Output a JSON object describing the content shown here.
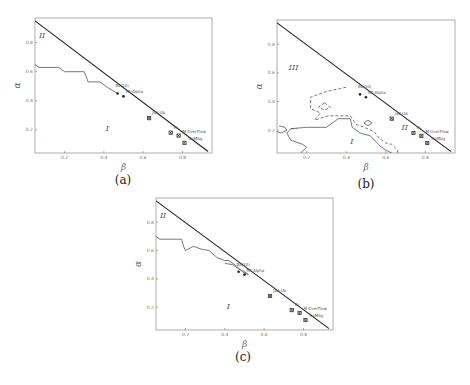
{
  "figure": {
    "panels": [
      {
        "id": "a",
        "caption": "(a)"
      },
      {
        "id": "b",
        "caption": "(b)"
      },
      {
        "id": "c",
        "caption": "(c)"
      }
    ]
  },
  "chart_data": [
    {
      "type": "line",
      "panel": "(a)",
      "xlabel": "β",
      "ylabel": "α",
      "xlim": [
        0.05,
        0.95
      ],
      "ylim": [
        0.04,
        0.97
      ],
      "xticks": [
        0.2,
        0.4,
        0.6,
        0.8
      ],
      "yticks": [
        0.2,
        0.4,
        0.6,
        0.8
      ],
      "grid": false,
      "boundary_line": [
        [
          0.05,
          0.95
        ],
        [
          0.93,
          0.05
        ]
      ],
      "curves": [
        {
          "name": "phase boundary",
          "style": "solid",
          "points": [
            [
              0.05,
              0.65
            ],
            [
              0.07,
              0.63
            ],
            [
              0.17,
              0.63
            ],
            [
              0.2,
              0.6
            ],
            [
              0.3,
              0.6
            ],
            [
              0.31,
              0.57
            ],
            [
              0.32,
              0.53
            ],
            [
              0.38,
              0.53
            ],
            [
              0.42,
              0.49
            ],
            [
              0.47,
              0.45
            ]
          ]
        }
      ],
      "regions": [
        {
          "label": "II",
          "x": 0.07,
          "y": 0.83
        },
        {
          "label": "I",
          "x": 0.41,
          "y": 0.19
        }
      ],
      "points": [
        {
          "label": "Bk(10)",
          "x": 0.47,
          "y": 0.45,
          "marker": "dot"
        },
        {
          "label": "RF-Alpha",
          "x": 0.5,
          "y": 0.43,
          "marker": "dot"
        },
        {
          "label": "Jad-Ub",
          "x": 0.63,
          "y": 0.28,
          "marker": "x"
        },
        {
          "label": "Rc",
          "x": 0.74,
          "y": 0.18,
          "marker": "x"
        },
        {
          "label": "M OverFlow",
          "x": 0.78,
          "y": 0.16,
          "marker": "x"
        },
        {
          "label": "CoMbg",
          "x": 0.81,
          "y": 0.11,
          "marker": "x"
        }
      ]
    },
    {
      "type": "line",
      "panel": "(b)",
      "xlabel": "β",
      "ylabel": "α",
      "xlim": [
        0.05,
        0.95
      ],
      "ylim": [
        0.04,
        0.97
      ],
      "xticks": [
        0.2,
        0.4,
        0.6,
        0.8
      ],
      "yticks": [
        0.2,
        0.4,
        0.6,
        0.8
      ],
      "grid": false,
      "boundary_line": [
        [
          0.05,
          0.95
        ],
        [
          0.93,
          0.05
        ]
      ],
      "curves": [
        {
          "name": "region I boundary",
          "style": "solid",
          "points": [
            [
              0.17,
              0.04
            ],
            [
              0.2,
              0.08
            ],
            [
              0.18,
              0.1
            ],
            [
              0.12,
              0.13
            ],
            [
              0.1,
              0.18
            ],
            [
              0.12,
              0.21
            ],
            [
              0.2,
              0.22
            ],
            [
              0.3,
              0.22
            ],
            [
              0.36,
              0.28
            ],
            [
              0.42,
              0.28
            ],
            [
              0.43,
              0.22
            ],
            [
              0.47,
              0.18
            ],
            [
              0.52,
              0.16
            ],
            [
              0.55,
              0.12
            ],
            [
              0.57,
              0.09
            ],
            [
              0.6,
              0.06
            ],
            [
              0.63,
              0.04
            ]
          ]
        },
        {
          "name": "region III boundary",
          "style": "dashed",
          "points": [
            [
              0.4,
              0.5
            ],
            [
              0.3,
              0.47
            ],
            [
              0.22,
              0.43
            ],
            [
              0.22,
              0.35
            ],
            [
              0.27,
              0.32
            ],
            [
              0.24,
              0.27
            ],
            [
              0.31,
              0.3
            ],
            [
              0.36,
              0.3
            ],
            [
              0.42,
              0.3
            ],
            [
              0.45,
              0.24
            ],
            [
              0.49,
              0.22
            ],
            [
              0.54,
              0.19
            ],
            [
              0.57,
              0.14
            ],
            [
              0.6,
              0.11
            ],
            [
              0.63,
              0.1
            ],
            [
              0.66,
              0.06
            ],
            [
              0.66,
              0.04
            ]
          ]
        },
        {
          "name": "region III island",
          "style": "dashed",
          "points": [
            [
              0.29,
              0.39
            ],
            [
              0.32,
              0.36
            ],
            [
              0.29,
              0.34
            ],
            [
              0.26,
              0.36
            ],
            [
              0.29,
              0.39
            ]
          ]
        },
        {
          "name": "small island",
          "style": "solid",
          "points": [
            [
              0.51,
              0.27
            ],
            [
              0.53,
              0.25
            ],
            [
              0.51,
              0.23
            ],
            [
              0.49,
              0.25
            ],
            [
              0.51,
              0.27
            ]
          ]
        },
        {
          "name": "left island",
          "style": "solid",
          "points": [
            [
              0.06,
              0.23
            ],
            [
              0.09,
              0.22
            ],
            [
              0.1,
              0.2
            ],
            [
              0.07,
              0.18
            ],
            [
              0.05,
              0.19
            ]
          ]
        },
        {
          "name": "left connector",
          "style": "dashed",
          "points": [
            [
              0.12,
              0.21
            ],
            [
              0.15,
              0.21
            ]
          ]
        }
      ],
      "regions": [
        {
          "label": "III",
          "x": 0.11,
          "y": 0.62
        },
        {
          "label": "II",
          "x": 0.68,
          "y": 0.2
        },
        {
          "label": "I",
          "x": 0.42,
          "y": 0.1
        }
      ],
      "points": [
        {
          "label": "Bk(10)",
          "x": 0.47,
          "y": 0.45,
          "marker": "dot"
        },
        {
          "label": "RF-Alpha",
          "x": 0.5,
          "y": 0.43,
          "marker": "dot"
        },
        {
          "label": "Jad-Ub",
          "x": 0.63,
          "y": 0.28,
          "marker": "x"
        },
        {
          "label": "Rc",
          "x": 0.74,
          "y": 0.18,
          "marker": "x"
        },
        {
          "label": "M OverFlow",
          "x": 0.78,
          "y": 0.16,
          "marker": "x"
        },
        {
          "label": "CoMbg",
          "x": 0.81,
          "y": 0.11,
          "marker": "x"
        }
      ]
    },
    {
      "type": "line",
      "panel": "(c)",
      "xlabel": "β",
      "ylabel": "α",
      "xlim": [
        0.05,
        0.95
      ],
      "ylim": [
        0.04,
        0.97
      ],
      "xticks": [
        0.2,
        0.4,
        0.6,
        0.8
      ],
      "yticks": [
        0.2,
        0.4,
        0.6,
        0.8
      ],
      "grid": false,
      "boundary_line": [
        [
          0.05,
          0.95
        ],
        [
          0.93,
          0.05
        ]
      ],
      "curves": [
        {
          "name": "phase boundary",
          "style": "solid",
          "points": [
            [
              0.05,
              0.7
            ],
            [
              0.07,
              0.68
            ],
            [
              0.18,
              0.68
            ],
            [
              0.19,
              0.63
            ],
            [
              0.2,
              0.6
            ],
            [
              0.24,
              0.63
            ],
            [
              0.28,
              0.61
            ],
            [
              0.32,
              0.6
            ],
            [
              0.36,
              0.55
            ],
            [
              0.4,
              0.53
            ],
            [
              0.42,
              0.53
            ],
            [
              0.46,
              0.49
            ],
            [
              0.49,
              0.45
            ],
            [
              0.52,
              0.43
            ],
            [
              0.5,
              0.45
            ],
            [
              0.47,
              0.47
            ],
            [
              0.44,
              0.5
            ],
            [
              0.4,
              0.51
            ]
          ]
        }
      ],
      "regions": [
        {
          "label": "II",
          "x": 0.07,
          "y": 0.83
        },
        {
          "label": "I",
          "x": 0.41,
          "y": 0.19
        }
      ],
      "points": [
        {
          "label": "Bk(10)",
          "x": 0.47,
          "y": 0.45,
          "marker": "dot"
        },
        {
          "label": "RF-Alpha",
          "x": 0.5,
          "y": 0.43,
          "marker": "dot"
        },
        {
          "label": "Jad-Ub",
          "x": 0.63,
          "y": 0.28,
          "marker": "x"
        },
        {
          "label": "Rc",
          "x": 0.74,
          "y": 0.18,
          "marker": "x"
        },
        {
          "label": "M OverFlow",
          "x": 0.78,
          "y": 0.16,
          "marker": "x"
        },
        {
          "label": "CoMbg",
          "x": 0.81,
          "y": 0.11,
          "marker": "x"
        }
      ]
    }
  ]
}
